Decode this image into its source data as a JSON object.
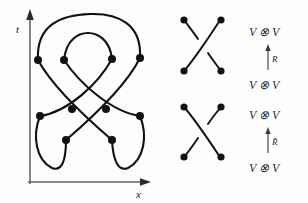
{
  "figure": {
    "background_color": "#fdfdfd",
    "ink_color": "#111111"
  },
  "spacetime_diagram": {
    "name": "knot-spacetime-diagram",
    "vertical_axis_label": "t",
    "horizontal_axis_label": "x",
    "axis_color": "#5f5f5f",
    "vertex_count": 12,
    "description": "Closed braid / link diagram drawn in the x-t plane with marked crossing vertices"
  },
  "crossings": [
    {
      "name": "positive-crossing",
      "over_strand": "bottom-left-to-top-right",
      "under_strand": "top-left-to-bottom-right",
      "endpoint_count": 4
    },
    {
      "name": "negative-crossing",
      "over_strand": "top-left-to-bottom-right",
      "under_strand": "bottom-left-to-top-right",
      "endpoint_count": 4
    }
  ],
  "relations": [
    {
      "name": "r-matrix-relation",
      "target": "V ⊗ V",
      "operator": "R",
      "source": "V ⊗ V",
      "arrow_direction": "up"
    },
    {
      "name": "r-check-matrix-relation",
      "target": "V ⊗ V",
      "operator": "Ř",
      "source": "V ⊗ V",
      "arrow_direction": "up"
    }
  ]
}
